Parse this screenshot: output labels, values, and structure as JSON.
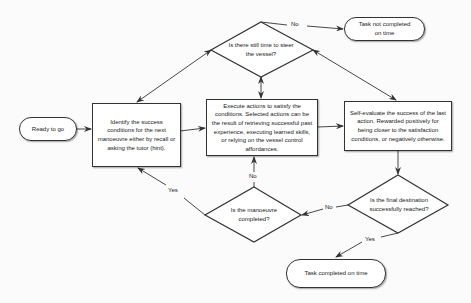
{
  "diagram": {
    "type": "flowchart",
    "nodes": {
      "start": {
        "shape": "terminal",
        "label": "Ready to go"
      },
      "identify": {
        "shape": "process",
        "label": "Identify the success conditions for the next manoeuvre either by recall or asking the tutor (hint)."
      },
      "execute": {
        "shape": "process",
        "label": "Execute actions to satisfy the conditions. Selected actions can be the result of retrieving successful past experience, executing learned skills, or relying on the vessel control affordances."
      },
      "evaluate": {
        "shape": "process",
        "label": "Self-evaluate the success of the last action.  Rewarded positively for being closer to the satisfaction conditions, or negatively otherwise."
      },
      "time_check": {
        "shape": "decision",
        "label": "Is there still time to steer the vessel?"
      },
      "manoeuvre_check": {
        "shape": "decision",
        "label": "Is the manoeuvre completed?"
      },
      "destination_check": {
        "shape": "decision",
        "label": "Is the final destination successfully reached?"
      },
      "fail": {
        "shape": "terminal",
        "label": "Task not completed on time"
      },
      "success": {
        "shape": "terminal",
        "label": "Task completed on time"
      }
    },
    "edge_labels": {
      "time_no": "No",
      "manoeuvre_no": "No",
      "manoeuvre_yes": "Yes",
      "destination_no": "No",
      "destination_yes": "Yes"
    },
    "edges": [
      {
        "from": "start",
        "to": "identify"
      },
      {
        "from": "identify",
        "to": "execute"
      },
      {
        "from": "execute",
        "to": "evaluate"
      },
      {
        "from": "evaluate",
        "to": "destination_check"
      },
      {
        "from": "destination_check",
        "to": "manoeuvre_check",
        "label": "No"
      },
      {
        "from": "destination_check",
        "to": "success",
        "label": "Yes"
      },
      {
        "from": "manoeuvre_check",
        "to": "execute",
        "label": "No"
      },
      {
        "from": "manoeuvre_check",
        "to": "identify",
        "label": "Yes"
      },
      {
        "from": "time_check",
        "to": "fail",
        "label": "No"
      },
      {
        "between": [
          "time_check",
          "identify"
        ],
        "bidirectional": true
      },
      {
        "between": [
          "time_check",
          "execute"
        ],
        "bidirectional": true
      },
      {
        "between": [
          "time_check",
          "evaluate"
        ],
        "bidirectional": true
      }
    ],
    "colors": {
      "stroke": "#333333",
      "fill": "#ffffff",
      "background": "#fbfbfb"
    }
  }
}
